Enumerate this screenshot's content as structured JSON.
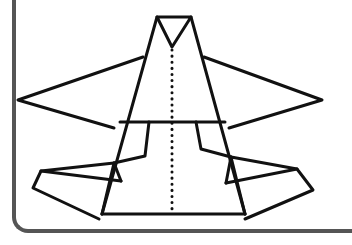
{
  "figure": {
    "colors": {
      "stroke": "#111111",
      "frame": "#555555",
      "background": "#ffffff"
    },
    "stroke_width": 3,
    "fold_line": {
      "style": "dotted",
      "x": 172,
      "y_start": 50,
      "y_end": 212
    },
    "polylines": [
      {
        "name": "nose-triangle",
        "points": "157,17 191,17 172,47 157,17"
      },
      {
        "name": "body-left-edge",
        "points": "157,17 102,214"
      },
      {
        "name": "body-right-edge",
        "points": "191,17 245,214"
      },
      {
        "name": "body-bottom",
        "points": "102,214 245,214"
      },
      {
        "name": "waist-line",
        "points": "120,122 225,122"
      },
      {
        "name": "left-wing",
        "points": "143,57 18,100 114,128"
      },
      {
        "name": "right-wing",
        "points": "204,57 322,100 229,128"
      },
      {
        "name": "left-flap-inner",
        "points": "149,122 145,156 114,163 102,214"
      },
      {
        "name": "left-flap-outer",
        "points": "114,163 41,171 33,188 99,219"
      },
      {
        "name": "left-flap-diagonal",
        "points": "41,171 121,181"
      },
      {
        "name": "left-flap-strut",
        "points": "114,163 121,181"
      },
      {
        "name": "right-flap-inner",
        "points": "196,122 201,149 231,157 245,214"
      },
      {
        "name": "right-flap-outer",
        "points": "231,157 297,169 313,190 245,219"
      },
      {
        "name": "right-flap-diagonal",
        "points": "297,169 226,183"
      },
      {
        "name": "right-flap-strut",
        "points": "231,157 226,183"
      }
    ]
  }
}
